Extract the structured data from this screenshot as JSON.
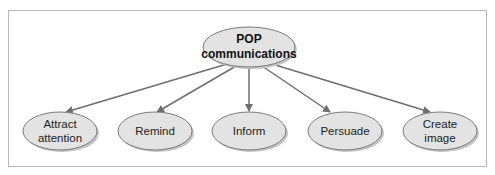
{
  "diagram": {
    "caption": "Figure — The purposes of POP communications",
    "colors": {
      "node_fill": "#e3e3e3",
      "node_stroke": "#7a7a7a",
      "shadow": "#c4c4c4",
      "arrow": "#6e6e6e",
      "frame": "#b8b8b8"
    },
    "root": {
      "line1": "POP",
      "line2": "communications"
    },
    "children": [
      {
        "line1": "Attract",
        "line2": "attention"
      },
      {
        "line1": "Remind",
        "line2": ""
      },
      {
        "line1": "Inform",
        "line2": ""
      },
      {
        "line1": "Persuade",
        "line2": ""
      },
      {
        "line1": "Create",
        "line2": "image"
      }
    ]
  }
}
